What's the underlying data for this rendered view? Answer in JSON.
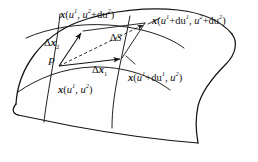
{
  "figure": {
    "background_color": "#fefefe",
    "stroke_color": "#141414",
    "labels": {
      "corner_top_left": {
        "name": "x-u1-u2-plus-du2",
        "vector": "x",
        "open": "(",
        "arg1_base": "u",
        "arg1_sup": "1",
        "comma": ", ",
        "arg2_base": "u",
        "arg2_sup": "2",
        "arg2_plus": "+du",
        "arg2_plus_sup": "2",
        "close": ")",
        "text": "x(u1, u2+du2)"
      },
      "corner_top_right": {
        "name": "x-u1-plus-du1-u2-plus-du2",
        "vector": "x",
        "open": "(",
        "arg1_base": "u",
        "arg1_sup": "1",
        "arg1_plus": "+du",
        "arg1_plus_sup": "1",
        "comma": ", ",
        "arg2_base": "u",
        "arg2_sup": "2",
        "arg2_plus": "+du",
        "arg2_plus_sup": "2",
        "close": ")",
        "text": "x(u1+du1, u2+du2)"
      },
      "corner_right": {
        "name": "x-u1-plus-du1-u2",
        "vector": "x",
        "open": "(",
        "arg1_base": "u",
        "arg1_sup": "1",
        "arg1_plus": "+du",
        "arg1_plus_sup": "1",
        "comma": ", ",
        "arg2_base": "u",
        "arg2_sup": "2",
        "close": ")",
        "text": "x(u1+du1, u2)"
      },
      "corner_bottom_left": {
        "name": "x-u1-u2",
        "vector": "x",
        "open": "(",
        "arg1_base": "u",
        "arg1_sup": "1",
        "comma": ", ",
        "arg2_base": "u",
        "arg2_sup": "2",
        "close": ")",
        "text": "x(u1, u2)"
      },
      "vector_dx2": {
        "name": "delta-x-2",
        "delta": "Δ",
        "vector": "x",
        "sub": "2",
        "text": "Δx2"
      },
      "vector_dx1": {
        "name": "delta-x-1",
        "delta": "Δ",
        "vector": "x",
        "sub": "1",
        "text": "Δx1"
      },
      "area_element": {
        "name": "delta-S",
        "delta": "Δ",
        "symbol": "S",
        "text": "ΔS"
      },
      "point": {
        "name": "point-P",
        "symbol": "P",
        "text": "P"
      }
    },
    "geometry": {
      "surface_patch": "curved quadrilateral sheet",
      "coordinate_curves": 4,
      "vectors": [
        {
          "label": "Δx2",
          "style": "solid",
          "direction": "up-left"
        },
        {
          "label": "Δx1",
          "style": "solid",
          "direction": "right"
        },
        {
          "label": "diagonal",
          "style": "dashed",
          "direction": "up-right"
        }
      ]
    }
  }
}
